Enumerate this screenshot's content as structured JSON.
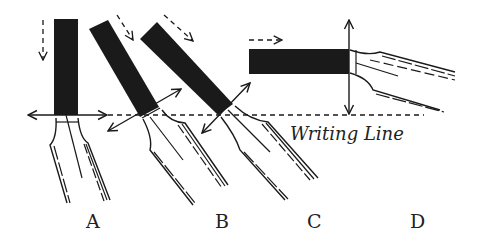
{
  "diagram": {
    "type": "pen-nib-angle-illustration",
    "writing_line_label": "Writing Line",
    "nibs": [
      {
        "id": "A",
        "label": "A",
        "angle_deg": 90
      },
      {
        "id": "B",
        "label": "B",
        "angle_deg": 30
      },
      {
        "id": "C",
        "label": "C",
        "angle_deg": 45
      },
      {
        "id": "D",
        "label": "D",
        "angle_deg": 0
      }
    ],
    "colors": {
      "ink": "#1a1a1a",
      "background": "#ffffff"
    }
  }
}
